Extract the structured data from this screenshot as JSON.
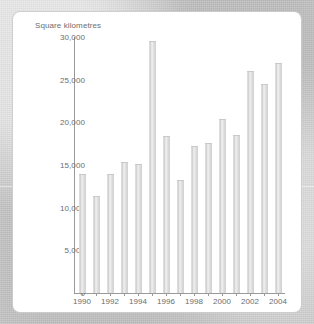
{
  "panel": {
    "title": "Square kilometres"
  },
  "chart_data": {
    "type": "bar",
    "title": "Square kilometres",
    "xlabel": "",
    "ylabel": "Square kilometres",
    "ylim": [
      0,
      30000
    ],
    "grid": false,
    "legend": null,
    "categories": [
      "1990",
      "1991",
      "1992",
      "1993",
      "1994",
      "1995",
      "1996",
      "1997",
      "1998",
      "1999",
      "2000",
      "2001",
      "2002",
      "2003",
      "2004"
    ],
    "values": [
      13900,
      11400,
      13900,
      15300,
      15100,
      29500,
      18400,
      13200,
      17200,
      17600,
      20400,
      18500,
      26000,
      24500,
      27000
    ],
    "y_ticks": [
      {
        "value": 30000,
        "label": "30,000"
      },
      {
        "value": 25000,
        "label": "25,000"
      },
      {
        "value": 20000,
        "label": "20,000"
      },
      {
        "value": 15000,
        "label": "15,000"
      },
      {
        "value": 10000,
        "label": "10,000"
      },
      {
        "value": 5000,
        "label": "5,000"
      },
      {
        "value": 0,
        "label": "0"
      }
    ],
    "x_tick_labels": [
      "1990",
      "1992",
      "1994",
      "1996",
      "1998",
      "2000",
      "2002",
      "2004"
    ],
    "bar_color": "#d8d8d8",
    "axis_color": "#9a9a9a",
    "text_color": "#6d6d6d",
    "panel_color": "#ffffff"
  }
}
